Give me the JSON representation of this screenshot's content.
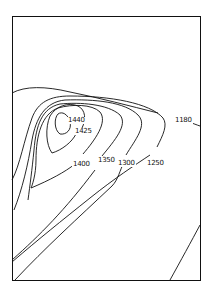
{
  "diagram": {
    "type": "contour-map",
    "contour_labels": [
      {
        "id": "c1440",
        "text": "1440",
        "x": 69,
        "y": 118
      },
      {
        "id": "c1425",
        "text": "1425",
        "x": 75,
        "y": 128
      },
      {
        "id": "c1400",
        "text": "1400",
        "x": 73,
        "y": 160
      },
      {
        "id": "c1350",
        "text": "1350",
        "x": 97,
        "y": 157
      },
      {
        "id": "c1300",
        "text": "1300",
        "x": 117,
        "y": 160
      },
      {
        "id": "c1250",
        "text": "1250",
        "x": 146,
        "y": 160
      },
      {
        "id": "c1180",
        "text": "1180",
        "x": 174,
        "y": 117
      }
    ],
    "colors": {
      "line": "#111111",
      "background": "#ffffff"
    }
  }
}
